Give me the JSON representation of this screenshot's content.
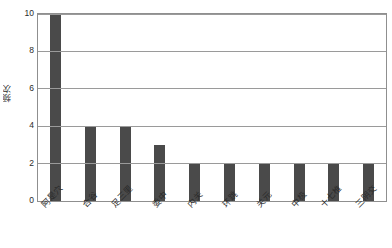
{
  "chart_data": {
    "type": "bar",
    "title": "",
    "xlabel": "",
    "ylabel": "频次",
    "ylim": [
      0,
      10
    ],
    "yticks": [
      0,
      2,
      4,
      6,
      8,
      10
    ],
    "grid": true,
    "legend": false,
    "legend_position": "none",
    "bar_color": "#4a4a4a",
    "frame_color": "#8f8f8f",
    "gridline_color": "#9a9a9a",
    "background": "#ffffff",
    "xtick_rotation": -45,
    "categories": [
      "阿是穴",
      "合谷",
      "足三里",
      "委中",
      "内关",
      "环跳",
      "关元",
      "中极",
      "十七椎",
      "三阴交"
    ],
    "values": [
      10,
      4,
      4,
      3,
      2,
      2,
      2,
      2,
      2,
      2
    ]
  }
}
